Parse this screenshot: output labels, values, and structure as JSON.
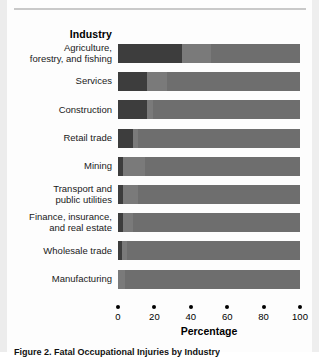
{
  "chart_data": {
    "type": "bar",
    "orientation": "horizontal",
    "stacked": true,
    "title": "",
    "xlabel": "Percentage",
    "ylabel": "Industry",
    "xlim": [
      0,
      100
    ],
    "xticks": [
      0,
      20,
      40,
      60,
      80,
      100
    ],
    "xtick_labels": [
      "0",
      "20",
      "40",
      "60",
      "80",
      "100"
    ],
    "grid": false,
    "legend": "none",
    "categories": [
      "Agriculture, forestry, and fishing",
      "Services",
      "Construction",
      "Retail trade",
      "Mining",
      "Transport and public utilities",
      "Finance, insurance, and real estate",
      "Wholesale trade",
      "Manufacturing"
    ],
    "category_lines": [
      [
        "Agriculture,",
        "forestry, and fishing"
      ],
      [
        "Services"
      ],
      [
        "Construction"
      ],
      [
        "Retail trade"
      ],
      [
        "Mining"
      ],
      [
        "Transport and",
        "public utilities"
      ],
      [
        "Finance, insurance,",
        "and real estate"
      ],
      [
        "Wholesale trade"
      ],
      [
        "Manufacturing"
      ]
    ],
    "series": [
      {
        "name": "segment-1",
        "color": "#3d3d3d",
        "values": [
          35,
          16,
          16,
          8,
          3,
          3,
          3,
          2,
          0
        ]
      },
      {
        "name": "segment-2",
        "color": "#7a7a7a",
        "values": [
          16,
          11,
          3,
          3,
          12,
          8,
          5,
          3,
          4
        ]
      },
      {
        "name": "segment-3",
        "color": "#6e6e6e",
        "values": [
          49,
          73,
          81,
          89,
          85,
          89,
          92,
          95,
          96
        ]
      }
    ]
  },
  "caption": "Figure 2. Fatal Occupational Injuries by Industry"
}
